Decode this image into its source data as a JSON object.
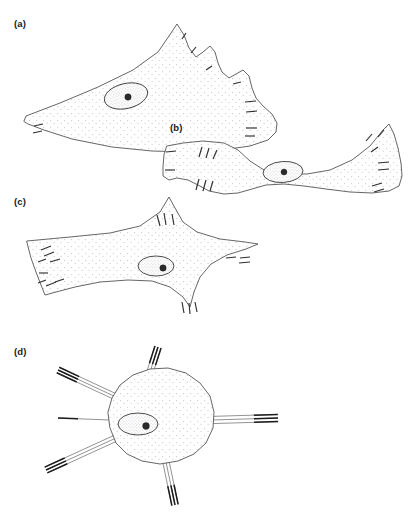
{
  "figure": {
    "type": "scientific-line-drawing",
    "background_color": "#ffffff",
    "line_color": "#4a4a4a",
    "stipple_color": "#c9c2cc",
    "nucleolus_color": "#2a2a2a",
    "width": 420,
    "height": 517
  },
  "panels": [
    {
      "id": "a",
      "label": "(a)",
      "label_x": 14,
      "label_y": 27,
      "shape": "wedge-fan-cell",
      "description": "Broad fan-shaped cell with a long tapering tail to the left and a lobed, scalloped right margin bearing short dark marginal dashes.",
      "outline": "M 24 121 L 26 116 L 60 103 L 98 87 L 133 70 L 158 52 L 171 33 L 177 24 L 184 35 L 189 48 L 196 57 L 203 52 L 210 46 L 215 52 L 218 63 L 222 72 L 229 78 L 236 74 L 243 70 L 249 76 L 252 88 L 256 98 L 263 106 L 272 114 L 277 123 L 276 132 L 268 140 L 250 146 L 222 150 L 190 152 L 152 151 L 112 147 L 72 139 L 44 130 L 28 124 Z",
      "nucleus": {
        "cx": 126,
        "cy": 96,
        "rx": 22,
        "ry": 12.5,
        "rotate": -13,
        "nucleolus": {
          "cx": 128,
          "cy": 97,
          "r": 3.2
        }
      },
      "edge_dashes": [
        {
          "x1": 182,
          "y1": 39,
          "x2": 186,
          "y2": 33
        },
        {
          "x1": 191,
          "y1": 53,
          "x2": 196,
          "y2": 47
        },
        {
          "x1": 206,
          "y1": 70,
          "x2": 212,
          "y2": 66
        },
        {
          "x1": 233,
          "y1": 84,
          "x2": 241,
          "y2": 82
        },
        {
          "x1": 245,
          "y1": 102,
          "x2": 256,
          "y2": 101
        },
        {
          "x1": 246,
          "y1": 112,
          "x2": 257,
          "y2": 111
        },
        {
          "x1": 246,
          "y1": 128,
          "x2": 257,
          "y2": 128
        },
        {
          "x1": 245,
          "y1": 136,
          "x2": 255,
          "y2": 136
        },
        {
          "x1": 34,
          "y1": 126,
          "x2": 43,
          "y2": 124
        },
        {
          "x1": 33,
          "y1": 133,
          "x2": 42,
          "y2": 131
        }
      ]
    },
    {
      "id": "b",
      "label": "(b)",
      "label_x": 170,
      "label_y": 131,
      "shape": "bipolar-bowtie-cell",
      "description": "Bipolar cell with two flared terminal expansions joined by a narrow central bridge containing the nucleus; marginal dashes on both expanded ends.",
      "outline": "M 167 146 L 183 143 L 203 141 L 224 143 L 238 150 L 250 161 L 264 170 L 283 174 L 307 174 L 330 170 L 352 160 L 370 146 L 383 130 L 389 124 L 394 134 L 398 148 L 401 163 L 402 176 L 399 186 L 389 191 L 372 193 L 350 192 L 326 189 L 304 186 L 284 184 L 266 185 L 252 189 L 238 193 L 224 194 L 209 191 L 198 185 L 188 180 L 177 178 L 169 180 L 163 176 L 163 166 L 164 155 Z",
      "nucleus": {
        "cx": 283,
        "cy": 172,
        "rx": 20,
        "ry": 10.5,
        "rotate": -4,
        "nucleolus": {
          "cx": 284,
          "cy": 172,
          "r": 3.0
        }
      },
      "edge_dashes": [
        {
          "x1": 166,
          "y1": 152,
          "x2": 176,
          "y2": 151
        },
        {
          "x1": 165,
          "y1": 170,
          "x2": 175,
          "y2": 170
        },
        {
          "x1": 199,
          "y1": 157,
          "x2": 202,
          "y2": 147
        },
        {
          "x1": 206,
          "y1": 158,
          "x2": 209,
          "y2": 148
        },
        {
          "x1": 213,
          "y1": 159,
          "x2": 217,
          "y2": 150
        },
        {
          "x1": 196,
          "y1": 190,
          "x2": 199,
          "y2": 179
        },
        {
          "x1": 203,
          "y1": 191,
          "x2": 206,
          "y2": 180
        },
        {
          "x1": 210,
          "y1": 191,
          "x2": 213,
          "y2": 181
        },
        {
          "x1": 366,
          "y1": 141,
          "x2": 372,
          "y2": 134
        },
        {
          "x1": 378,
          "y1": 137,
          "x2": 384,
          "y2": 130
        },
        {
          "x1": 371,
          "y1": 152,
          "x2": 378,
          "y2": 147
        },
        {
          "x1": 378,
          "y1": 163,
          "x2": 389,
          "y2": 162
        },
        {
          "x1": 378,
          "y1": 170,
          "x2": 389,
          "y2": 169
        },
        {
          "x1": 372,
          "y1": 186,
          "x2": 382,
          "y2": 183
        },
        {
          "x1": 374,
          "y1": 192,
          "x2": 384,
          "y2": 189
        }
      ]
    },
    {
      "id": "c",
      "label": "(c)",
      "label_x": 14,
      "label_y": 205,
      "shape": "four-point-stellate-cell",
      "description": "Flattened stellate cell with four drawn-out points and deeply concave intervening margins; clusters of short dashes at each point.",
      "outline": "M 27 241 L 70 237 L 110 233 L 140 226 L 160 212 L 169 197 L 175 208 L 183 222 L 197 232 L 220 239 L 245 242 L 258 244 L 246 249 L 227 255 L 211 264 L 200 277 L 194 292 L 190 307 L 183 297 L 170 287 L 152 281 L 128 280 L 100 282 L 75 287 L 56 292 L 45 295 L 41 285 L 36 272 L 31 258 Z",
      "nucleus": {
        "cx": 156,
        "cy": 266,
        "rx": 18,
        "ry": 10,
        "nucleolus": {
          "cx": 163,
          "cy": 268,
          "r": 3.2
        }
      },
      "edge_dashes": [
        {
          "x1": 41,
          "y1": 250,
          "x2": 51,
          "y2": 246
        },
        {
          "x1": 44,
          "y1": 256,
          "x2": 54,
          "y2": 252
        },
        {
          "x1": 38,
          "y1": 262,
          "x2": 46,
          "y2": 259
        },
        {
          "x1": 50,
          "y1": 262,
          "x2": 60,
          "y2": 259
        },
        {
          "x1": 39,
          "y1": 273,
          "x2": 48,
          "y2": 273
        },
        {
          "x1": 38,
          "y1": 283,
          "x2": 46,
          "y2": 280
        },
        {
          "x1": 46,
          "y1": 286,
          "x2": 56,
          "y2": 282
        },
        {
          "x1": 55,
          "y1": 282,
          "x2": 64,
          "y2": 279
        },
        {
          "x1": 157,
          "y1": 215,
          "x2": 160,
          "y2": 226
        },
        {
          "x1": 164,
          "y1": 213,
          "x2": 166,
          "y2": 225
        },
        {
          "x1": 172,
          "y1": 214,
          "x2": 174,
          "y2": 225
        },
        {
          "x1": 226,
          "y1": 258,
          "x2": 236,
          "y2": 257
        },
        {
          "x1": 240,
          "y1": 258,
          "x2": 250,
          "y2": 257
        },
        {
          "x1": 239,
          "y1": 263,
          "x2": 250,
          "y2": 262
        },
        {
          "x1": 182,
          "y1": 302,
          "x2": 184,
          "y2": 313
        },
        {
          "x1": 189,
          "y1": 303,
          "x2": 190,
          "y2": 314
        },
        {
          "x1": 195,
          "y1": 302,
          "x2": 197,
          "y2": 312
        }
      ]
    },
    {
      "id": "d",
      "label": "(d)",
      "label_x": 14,
      "label_y": 355,
      "shape": "radial-spiculate-cell",
      "description": "Rounded cell body bearing several bundles of long straight needle-like processes radiating outward, each bundle of two to three parallel filaments with darkened distal tips.",
      "outline": "M 108 412 L 112 398 L 120 385 L 133 375 L 150 369 L 168 368 L 186 373 L 200 383 L 210 396 L 214 412 L 213 428 L 206 443 L 194 454 L 178 461 L 160 464 L 142 461 L 127 454 L 116 443 L 110 428 Z",
      "nucleus": {
        "cx": 138,
        "cy": 424,
        "rx": 20,
        "ry": 11,
        "nucleolus": {
          "cx": 146,
          "cy": 426,
          "r": 3.4
        }
      },
      "processes": [
        {
          "name": "upper-bundle",
          "x1": 150,
          "y1": 372,
          "x2": 158,
          "y2": 347,
          "count": 3,
          "spread": 3.2,
          "tip": 18
        },
        {
          "name": "upper-left-bundle",
          "x1": 116,
          "y1": 397,
          "x2": 58,
          "y2": 370,
          "count": 3,
          "spread": 3.0,
          "tip": 22
        },
        {
          "name": "left-single",
          "x1": 110,
          "y1": 420,
          "x2": 58,
          "y2": 418,
          "count": 1,
          "spread": 0,
          "tip": 20
        },
        {
          "name": "lower-left-bundle",
          "x1": 116,
          "y1": 438,
          "x2": 46,
          "y2": 470,
          "count": 3,
          "spread": 3.2,
          "tip": 22
        },
        {
          "name": "right-bundle",
          "x1": 212,
          "y1": 420,
          "x2": 278,
          "y2": 418,
          "count": 3,
          "spread": 3.6,
          "tip": 24
        },
        {
          "name": "lower-bundle",
          "x1": 166,
          "y1": 462,
          "x2": 175,
          "y2": 505,
          "count": 3,
          "spread": 3.2,
          "tip": 20
        }
      ],
      "edge_dashes": []
    }
  ]
}
